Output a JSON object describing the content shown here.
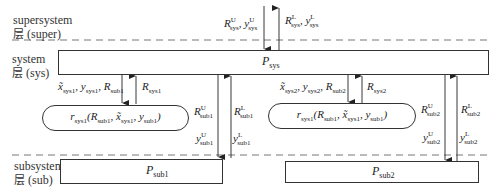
{
  "layers": {
    "supersystem": {
      "line1": "supersystem",
      "line2_zh": "层",
      "line2": "(super)"
    },
    "system": {
      "line1": "system",
      "line2_zh": "层",
      "line2": "(sys)"
    },
    "subsystem": {
      "line1": "subsystem",
      "line2_zh": "层",
      "line2": "(sub)"
    }
  },
  "boxes": {
    "sys": {
      "base": "P",
      "sub": "sys"
    },
    "sub1": {
      "base": "P",
      "sub": "sub1"
    },
    "sub2": {
      "base": "P",
      "sub": "sub2"
    }
  },
  "capsules": {
    "left": {
      "text": "r",
      "sub": "sys1",
      "args": "(R_sub1, x̃_sys1, y_sub1)"
    },
    "right": {
      "text": "r",
      "sub": "sys1",
      "args": "(R_sub1, x̃_sys1, y_sub1)"
    }
  },
  "labels": {
    "top_down": {
      "text": "R^U_sys, y^U_sys"
    },
    "top_up": {
      "text": "R^L_sys, y^L_sys"
    },
    "left_down": {
      "text": "x̃_sys1, y_sys1, R_sub1"
    },
    "left_up": {
      "text": "R_sys1"
    },
    "right_down": {
      "text": "x̃_sys2, y_sys2, R_sub2"
    },
    "right_up": {
      "text": "R_sys2"
    },
    "sub1_R_U": "R^U_sub1",
    "sub1_R_L": "R^L_sub1",
    "sub1_y_U": "y^U_sub1",
    "sub1_y_L": "y^L_sub1",
    "sub2_R_U": "R^U_sub2",
    "sub2_R_L": "R^L_sub2",
    "sub2_y_U": "y^U_sub2",
    "sub2_y_L": "y^L_sub2"
  },
  "colors": {
    "line": "#333333",
    "dash": "#777777"
  }
}
